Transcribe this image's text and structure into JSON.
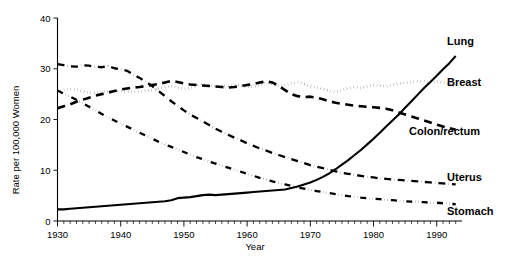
{
  "chart_data": {
    "type": "line",
    "title": "",
    "xlabel": "Year",
    "ylabel": "Rate per 100,000 Women",
    "xlim": [
      1930,
      1994
    ],
    "ylim": [
      0,
      40
    ],
    "yticks": [
      0,
      10,
      20,
      30,
      40
    ],
    "ytick_labels": [
      "0",
      "10",
      "20",
      "30",
      "40"
    ],
    "xticks": [
      1930,
      1940,
      1950,
      1960,
      1970,
      1980,
      1990
    ],
    "xtick_labels": [
      "1930",
      "1940",
      "1950",
      "1960",
      "1970",
      "1980",
      "1990"
    ],
    "minor_xtick_interval": 1,
    "grid": false,
    "legend_position": "inline-right",
    "x": [
      1930,
      1931,
      1932,
      1933,
      1934,
      1935,
      1936,
      1937,
      1938,
      1939,
      1940,
      1941,
      1942,
      1943,
      1944,
      1945,
      1946,
      1947,
      1948,
      1949,
      1950,
      1951,
      1952,
      1953,
      1954,
      1955,
      1956,
      1957,
      1958,
      1959,
      1960,
      1961,
      1962,
      1963,
      1964,
      1965,
      1966,
      1967,
      1968,
      1969,
      1970,
      1971,
      1972,
      1973,
      1974,
      1975,
      1976,
      1977,
      1978,
      1979,
      1980,
      1981,
      1982,
      1983,
      1984,
      1985,
      1986,
      1987,
      1988,
      1989,
      1990,
      1991,
      1992,
      1993
    ],
    "series": [
      {
        "name": "Lung",
        "style": "solid",
        "label_x": 1991,
        "label_y": 35.5,
        "values": [
          2.3,
          2.3,
          2.4,
          2.5,
          2.6,
          2.7,
          2.8,
          2.9,
          3.0,
          3.1,
          3.2,
          3.3,
          3.4,
          3.5,
          3.6,
          3.7,
          3.8,
          3.9,
          4.1,
          4.5,
          4.6,
          4.7,
          4.9,
          5.1,
          5.2,
          5.1,
          5.2,
          5.3,
          5.4,
          5.5,
          5.6,
          5.7,
          5.8,
          5.9,
          6.0,
          6.1,
          6.2,
          6.5,
          6.8,
          7.2,
          7.6,
          8.1,
          8.7,
          9.4,
          10.2,
          11.1,
          12.0,
          13.0,
          14.0,
          15.1,
          16.2,
          17.4,
          18.6,
          19.8,
          21.0,
          22.3,
          23.6,
          24.9,
          26.2,
          27.4,
          28.6,
          29.9,
          31.1,
          32.5
        ]
      },
      {
        "name": "Breast",
        "style": "dotted",
        "label_x": 1991,
        "label_y": 27.4,
        "values": [
          25.4,
          25.8,
          26.0,
          25.9,
          25.6,
          25.3,
          25.3,
          25.4,
          25.5,
          25.6,
          25.6,
          25.5,
          25.4,
          25.5,
          25.7,
          25.8,
          26.1,
          26.4,
          26.6,
          26.3,
          26.0,
          26.2,
          26.7,
          27.0,
          26.8,
          26.6,
          26.5,
          26.6,
          26.8,
          26.6,
          26.4,
          26.5,
          26.8,
          27.2,
          27.0,
          26.6,
          26.7,
          27.1,
          27.4,
          27.0,
          26.6,
          26.3,
          26.0,
          25.7,
          25.4,
          25.8,
          26.2,
          26.4,
          26.2,
          26.5,
          26.8,
          26.7,
          26.5,
          26.8,
          27.1,
          27.2,
          27.4,
          27.5,
          27.5,
          27.3,
          27.5,
          27.3,
          26.9,
          26.5
        ]
      },
      {
        "name": "Colon/rectum",
        "style": "dashed",
        "label_x": 1985,
        "label_y": 17.8,
        "values": [
          22.2,
          22.6,
          23.0,
          23.5,
          23.9,
          24.3,
          24.7,
          25.0,
          25.3,
          25.6,
          25.9,
          26.1,
          26.3,
          26.4,
          26.6,
          26.8,
          27.0,
          27.3,
          27.6,
          27.4,
          27.1,
          26.9,
          26.8,
          26.7,
          26.6,
          26.5,
          26.4,
          26.3,
          26.4,
          26.6,
          26.8,
          27.0,
          27.3,
          27.5,
          27.3,
          26.6,
          25.8,
          25.0,
          24.6,
          24.4,
          24.5,
          24.3,
          24.0,
          23.6,
          23.3,
          23.1,
          22.9,
          22.7,
          22.6,
          22.5,
          22.4,
          22.3,
          22.1,
          21.8,
          21.4,
          21.0,
          20.6,
          20.2,
          19.8,
          19.4,
          19.0,
          18.6,
          18.3,
          18.0
        ]
      },
      {
        "name": "Uterus",
        "style": "dashdot",
        "label_x": 1991,
        "label_y": 8.7,
        "values": [
          30.9,
          30.7,
          30.5,
          30.4,
          30.7,
          30.6,
          30.4,
          30.3,
          30.5,
          30.1,
          29.9,
          29.6,
          28.9,
          28.2,
          27.4,
          26.6,
          25.6,
          24.6,
          23.6,
          22.7,
          21.8,
          21.0,
          20.3,
          19.6,
          18.9,
          18.2,
          17.6,
          17.0,
          16.4,
          15.9,
          15.3,
          14.8,
          14.3,
          13.9,
          13.4,
          13.0,
          12.6,
          12.2,
          11.8,
          11.4,
          11.0,
          10.7,
          10.4,
          10.1,
          9.8,
          9.5,
          9.3,
          9.1,
          8.9,
          8.7,
          8.6,
          8.4,
          8.3,
          8.2,
          8.1,
          8.0,
          7.9,
          7.8,
          7.7,
          7.6,
          7.5,
          7.4,
          7.3,
          7.2
        ]
      },
      {
        "name": "Stomach",
        "style": "dashdotdot",
        "label_x": 1991,
        "label_y": 2.0,
        "values": [
          25.7,
          25.1,
          24.5,
          23.9,
          23.2,
          22.5,
          21.8,
          21.1,
          20.4,
          19.8,
          19.2,
          18.6,
          18.0,
          17.4,
          16.8,
          16.2,
          15.6,
          15.1,
          14.6,
          14.1,
          13.6,
          13.1,
          12.6,
          12.2,
          11.7,
          11.3,
          10.9,
          10.5,
          10.1,
          9.7,
          9.3,
          8.9,
          8.5,
          8.2,
          7.8,
          7.5,
          7.2,
          6.9,
          6.6,
          6.4,
          6.1,
          5.9,
          5.7,
          5.5,
          5.3,
          5.1,
          4.9,
          4.8,
          4.6,
          4.5,
          4.4,
          4.3,
          4.2,
          4.1,
          4.0,
          3.9,
          3.8,
          3.8,
          3.7,
          3.6,
          3.6,
          3.5,
          3.4,
          3.3
        ]
      }
    ]
  },
  "axis": {
    "ylabel": "Rate per 100,000 Women",
    "xlabel": "Year"
  },
  "labels": {
    "lung": "Lung",
    "breast": "Breast",
    "colon_rectum": "Colon/rectum",
    "uterus": "Uterus",
    "stomach": "Stomach"
  },
  "colors": {
    "line": "#000000",
    "background": "#ffffff",
    "axis": "#000000"
  }
}
